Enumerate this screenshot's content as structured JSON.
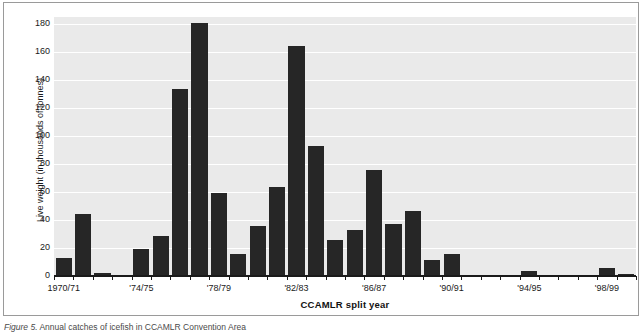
{
  "figure": {
    "caption_label": "Figure 5.",
    "caption_text": "Annual catches of icefish in CCAMLR Convention Area"
  },
  "axes": {
    "ylabel": "Live weight (in thousands of tonnes)",
    "xlabel": "CCAMLR split year",
    "yticks": [
      0,
      20,
      40,
      60,
      80,
      100,
      120,
      140,
      160,
      180
    ],
    "xtick_labels": [
      "1970/71",
      "'74/75",
      "'78/79",
      "'82/83",
      "'86/87",
      "'90/91",
      "'94/95",
      "'98/99"
    ],
    "xtick_indices": [
      0,
      4,
      8,
      12,
      16,
      20,
      24,
      28
    ]
  },
  "colors": {
    "bar": "#262626",
    "plot_background": "#eaeaea",
    "gridline": "#ffffff",
    "axis": "#1a1a1a",
    "frame": "#9a9a9a",
    "page": "#ffffff"
  },
  "chart_data": {
    "type": "bar",
    "title": "",
    "xlabel": "CCAMLR split year",
    "ylabel": "Live weight (in thousands of tonnes)",
    "ylim": [
      0,
      185
    ],
    "grid": true,
    "legend": "none",
    "categories": [
      "1970/71",
      "1971/72",
      "1972/73",
      "1973/74",
      "1974/75",
      "1975/76",
      "1976/77",
      "1977/78",
      "1978/79",
      "1979/80",
      "1980/81",
      "1981/82",
      "1982/83",
      "1983/84",
      "1984/85",
      "1985/86",
      "1986/87",
      "1987/88",
      "1988/89",
      "1989/90",
      "1990/91",
      "1991/92",
      "1992/93",
      "1993/94",
      "1994/95",
      "1995/96",
      "1996/97",
      "1997/98",
      "1998/99",
      "1999/00"
    ],
    "values": [
      13,
      44,
      2.5,
      0,
      19,
      28.5,
      133.5,
      181,
      59.5,
      16,
      35.5,
      63.5,
      164,
      93,
      26,
      33,
      76,
      37.5,
      46.5,
      11.5,
      15.5,
      0,
      0,
      0,
      3.5,
      0,
      0,
      0,
      5.5,
      1.5
    ]
  }
}
